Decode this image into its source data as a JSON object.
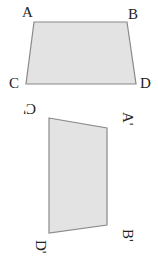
{
  "figure_original": {
    "labels": {
      "A": "A",
      "B": "B",
      "C": "C",
      "D": "D"
    },
    "fill": "#e3e3e3",
    "stroke": "#8a8a8a"
  },
  "figure_rotated": {
    "labels": {
      "A": "A'",
      "B": "B'",
      "C": "C'",
      "D": "D'"
    },
    "fill": "#e3e3e3",
    "stroke": "#8a8a8a"
  }
}
